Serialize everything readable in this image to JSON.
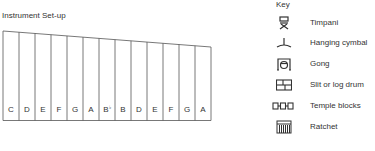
{
  "setup": {
    "title": "Instrument Set-up",
    "notes": [
      "C",
      "D",
      "E",
      "F",
      "G",
      "A",
      "B",
      "B",
      "D",
      "E",
      "F",
      "G",
      "A"
    ],
    "accidentals": {
      "6": "♭"
    }
  },
  "key": {
    "title": "Key",
    "items": [
      {
        "icon": "timpani-icon",
        "label": "Timpani"
      },
      {
        "icon": "hanging-cymbal-icon",
        "label": "Hanging cymbal"
      },
      {
        "icon": "gong-icon",
        "label": "Gong"
      },
      {
        "icon": "slit-drum-icon",
        "label": "Slit or log drum"
      },
      {
        "icon": "temple-blocks-icon",
        "label": "Temple blocks"
      },
      {
        "icon": "ratchet-icon",
        "label": "Ratchet"
      }
    ]
  }
}
